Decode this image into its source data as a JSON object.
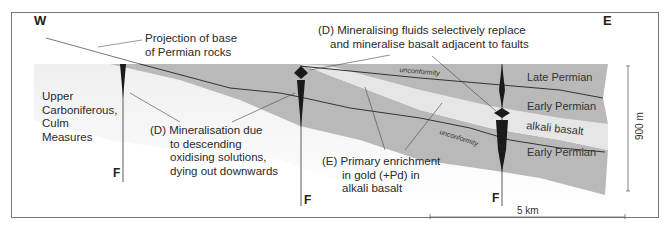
{
  "figure": {
    "type": "geological cross-section",
    "orientation": {
      "west": "W",
      "east": "E"
    }
  },
  "labels": {
    "projection": [
      "Projection of base",
      "of Permian rocks"
    ],
    "culm": [
      "Upper",
      "Carboniferous,",
      "Culm",
      "Measures"
    ],
    "mineralisation_descending": [
      "(D) Mineralisation due",
      "to descending",
      "oxidising solutions,",
      "dying out downwards"
    ],
    "mineralising_fluids": [
      "(D) Mineralising fluids selectively replace",
      "and mineralise basalt adjacent to faults"
    ],
    "primary_enrichment": [
      "(E) Primary enrichment",
      "in gold (+Pd) in",
      "alkali basalt"
    ]
  },
  "layers": {
    "late_permian": "Late Permian",
    "early_permian_upper": "Early Permian",
    "alkali_basalt": "alkali basalt",
    "early_permian_lower": "Early Permian"
  },
  "annotations": {
    "unconformity_upper": "unconformity",
    "unconformity_lower": "unconformity"
  },
  "faults": {
    "label": "F"
  },
  "scale": {
    "vertical": "900 m",
    "horizontal": "5 km"
  },
  "colors": {
    "permian_grey": "#b9b9b9",
    "basalt_light": "#e6e6e6",
    "carboniferous_light": "#eeeeee",
    "fault_black": "#1a1a1a",
    "line": "#333333"
  }
}
